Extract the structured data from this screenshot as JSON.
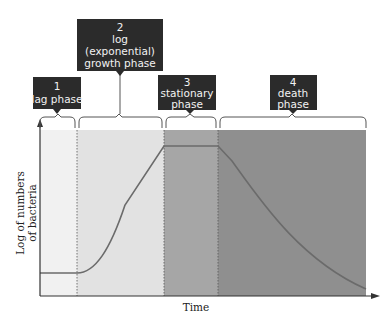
{
  "diagram": {
    "x_axis_label": "Time",
    "y_axis_label_line1": "Log of numbers",
    "y_axis_label_line2": "of bacteria",
    "phases": [
      {
        "number": "1",
        "line1": "lag phase",
        "line2": "",
        "line3": "",
        "fill": "#f1f1f1"
      },
      {
        "number": "2",
        "line1": "log",
        "line2": "(exponential)",
        "line3": "growth phase",
        "fill": "#e2e2e2"
      },
      {
        "number": "3",
        "line1": "stationary",
        "line2": "phase",
        "line3": "",
        "fill": "#a6a6a6"
      },
      {
        "number": "4",
        "line1": "death",
        "line2": "phase",
        "line3": "",
        "fill": "#8f8f8f"
      }
    ],
    "colors": {
      "label_box": "#2b2b2b",
      "label_text": "#f2f2f2",
      "curve": "#6b6b6b",
      "axis": "#333333"
    }
  }
}
